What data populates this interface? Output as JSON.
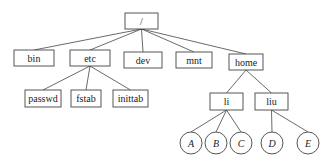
{
  "diagram": {
    "type": "directory-tree",
    "colors": {
      "stroke": "#444444",
      "text": "#222222",
      "background": "#ffffff"
    },
    "nodes": {
      "root": {
        "label": "/",
        "shape": "box",
        "x": 125,
        "y": 13,
        "w": 33,
        "h": 16
      },
      "bin": {
        "label": "bin",
        "shape": "box",
        "x": 14,
        "y": 50,
        "w": 40,
        "h": 16
      },
      "etc": {
        "label": "etc",
        "shape": "box",
        "x": 70,
        "y": 50,
        "w": 40,
        "h": 16
      },
      "dev": {
        "label": "dev",
        "shape": "box",
        "x": 124,
        "y": 52,
        "w": 38,
        "h": 16
      },
      "mnt": {
        "label": "mnt",
        "shape": "box",
        "x": 176,
        "y": 52,
        "w": 36,
        "h": 16
      },
      "home": {
        "label": "home",
        "shape": "box",
        "x": 229,
        "y": 54,
        "w": 34,
        "h": 16
      },
      "passwd": {
        "label": "passwd",
        "shape": "box",
        "x": 25,
        "y": 90,
        "w": 36,
        "h": 17
      },
      "fstab": {
        "label": "fstab",
        "shape": "box",
        "x": 71,
        "y": 90,
        "w": 30,
        "h": 17
      },
      "inittab": {
        "label": "inittab",
        "shape": "box",
        "x": 113,
        "y": 90,
        "w": 35,
        "h": 17
      },
      "li": {
        "label": "li",
        "shape": "box",
        "x": 210,
        "y": 93,
        "w": 33,
        "h": 17
      },
      "liu": {
        "label": "liu",
        "shape": "box",
        "x": 255,
        "y": 93,
        "w": 33,
        "h": 17
      },
      "A": {
        "label": "A",
        "shape": "circle",
        "cx": 191,
        "cy": 143,
        "r": 11
      },
      "B": {
        "label": "B",
        "shape": "circle",
        "cx": 216,
        "cy": 143,
        "r": 11
      },
      "C": {
        "label": "C",
        "shape": "circle",
        "cx": 241,
        "cy": 143,
        "r": 11
      },
      "D": {
        "label": "D",
        "shape": "circle",
        "cx": 272,
        "cy": 143,
        "r": 11
      },
      "E": {
        "label": "E",
        "shape": "circle",
        "cx": 308,
        "cy": 143,
        "r": 11
      }
    },
    "edges": [
      [
        "root",
        "bin"
      ],
      [
        "root",
        "etc"
      ],
      [
        "root",
        "dev"
      ],
      [
        "root",
        "mnt"
      ],
      [
        "root",
        "home"
      ],
      [
        "etc",
        "passwd"
      ],
      [
        "etc",
        "fstab"
      ],
      [
        "etc",
        "inittab"
      ],
      [
        "home",
        "li"
      ],
      [
        "home",
        "liu"
      ],
      [
        "li",
        "A"
      ],
      [
        "li",
        "B"
      ],
      [
        "li",
        "C"
      ],
      [
        "liu",
        "D"
      ],
      [
        "liu",
        "E"
      ]
    ]
  }
}
